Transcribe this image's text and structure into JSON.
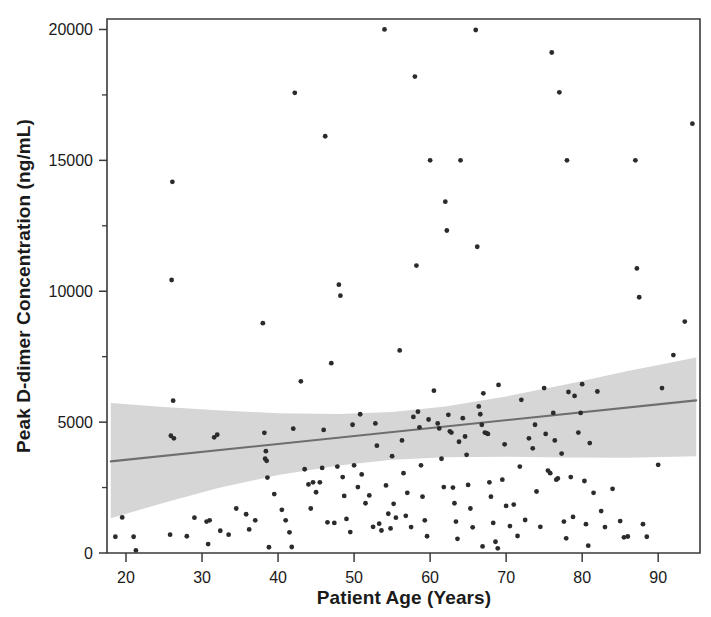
{
  "chart_data": {
    "type": "scatter",
    "title": "",
    "xlabel": "Patient Age (Years)",
    "ylabel": "Peak D-dimer Concentration (ng/mL)",
    "xlim": [
      17.5,
      95.5
    ],
    "ylim": [
      0,
      20400
    ],
    "xticks": [
      20,
      30,
      40,
      50,
      60,
      70,
      80,
      90
    ],
    "xtick_labels": [
      "20",
      "30",
      "40",
      "50",
      "60",
      "70",
      "80",
      "90"
    ],
    "yticks": [
      0,
      5000,
      10000,
      15000,
      20000
    ],
    "ytick_labels": [
      "0",
      "5000",
      "10000",
      "15000",
      "20000"
    ],
    "yticks_minor": [
      2500,
      7500,
      12500,
      17500
    ],
    "grid": false,
    "legend": null,
    "marker_color": "#2b2b2b",
    "marker_size_px": 2.4,
    "regression": {
      "name": "linear fit",
      "color": "#6e6e6e",
      "x": [
        18,
        95
      ],
      "y": [
        3500,
        5830
      ]
    },
    "confidence_band": {
      "name": "95% confidence interval",
      "color": "#d6d6d6",
      "x": [
        18,
        25,
        32,
        40,
        48,
        55,
        62,
        70,
        78,
        86,
        95
      ],
      "upper": [
        5730,
        5580,
        5450,
        5340,
        5310,
        5390,
        5600,
        5980,
        6450,
        6950,
        7470
      ],
      "lower": [
        1330,
        1920,
        2470,
        2980,
        3340,
        3560,
        3660,
        3680,
        3650,
        3640,
        3700
      ]
    },
    "points": [
      [
        26.0,
        10430
      ],
      [
        26.2,
        5820
      ],
      [
        26.3,
        4380
      ],
      [
        25.9,
        4480
      ],
      [
        21.0,
        620
      ],
      [
        21.3,
        100
      ],
      [
        25.8,
        700
      ],
      [
        26.1,
        14180
      ],
      [
        30.6,
        1200
      ],
      [
        31.0,
        1250
      ],
      [
        30.8,
        340
      ],
      [
        31.6,
        4420
      ],
      [
        32.0,
        4520
      ],
      [
        32.4,
        850
      ],
      [
        33.5,
        700
      ],
      [
        35.8,
        1480
      ],
      [
        38.0,
        8780
      ],
      [
        38.2,
        4590
      ],
      [
        38.4,
        3890
      ],
      [
        38.3,
        3600
      ],
      [
        38.5,
        3520
      ],
      [
        38.6,
        2880
      ],
      [
        38.8,
        220
      ],
      [
        36.2,
        900
      ],
      [
        41.0,
        1250
      ],
      [
        41.5,
        790
      ],
      [
        41.8,
        230
      ],
      [
        42.0,
        4750
      ],
      [
        42.2,
        17580
      ],
      [
        43.0,
        6560
      ],
      [
        44.0,
        2620
      ],
      [
        44.3,
        1700
      ],
      [
        44.6,
        2700
      ],
      [
        45.0,
        2320
      ],
      [
        45.5,
        2700
      ],
      [
        46.0,
        4700
      ],
      [
        46.2,
        15920
      ],
      [
        46.5,
        1170
      ],
      [
        47.0,
        7250
      ],
      [
        47.4,
        1150
      ],
      [
        48.0,
        10250
      ],
      [
        48.2,
        9830
      ],
      [
        48.5,
        2900
      ],
      [
        48.7,
        2180
      ],
      [
        49.0,
        1300
      ],
      [
        49.5,
        800
      ],
      [
        50.0,
        3350
      ],
      [
        50.5,
        2520
      ],
      [
        51.0,
        3000
      ],
      [
        51.5,
        1900
      ],
      [
        52.0,
        2200
      ],
      [
        52.5,
        1000
      ],
      [
        53.0,
        4100
      ],
      [
        53.3,
        1120
      ],
      [
        53.6,
        860
      ],
      [
        54.0,
        20000
      ],
      [
        54.2,
        2580
      ],
      [
        54.5,
        1500
      ],
      [
        54.8,
        940
      ],
      [
        55.0,
        3700
      ],
      [
        55.2,
        1880
      ],
      [
        55.5,
        1350
      ],
      [
        56.0,
        7740
      ],
      [
        56.3,
        4300
      ],
      [
        56.5,
        3050
      ],
      [
        56.8,
        1420
      ],
      [
        57.0,
        2300
      ],
      [
        57.5,
        990
      ],
      [
        58.0,
        18200
      ],
      [
        58.2,
        10980
      ],
      [
        58.4,
        5400
      ],
      [
        58.6,
        4800
      ],
      [
        58.8,
        3350
      ],
      [
        59.0,
        2150
      ],
      [
        59.3,
        1250
      ],
      [
        59.6,
        640
      ],
      [
        60.0,
        15000
      ],
      [
        60.5,
        6200
      ],
      [
        61.0,
        4950
      ],
      [
        61.2,
        4760
      ],
      [
        61.5,
        3600
      ],
      [
        61.8,
        2520
      ],
      [
        62.0,
        13420
      ],
      [
        62.2,
        12320
      ],
      [
        62.4,
        5280
      ],
      [
        62.6,
        4650
      ],
      [
        62.8,
        4600
      ],
      [
        63.0,
        2500
      ],
      [
        63.2,
        1900
      ],
      [
        63.4,
        1200
      ],
      [
        63.6,
        540
      ],
      [
        64.0,
        15000
      ],
      [
        64.3,
        5150
      ],
      [
        64.6,
        4450
      ],
      [
        65.0,
        2600
      ],
      [
        65.3,
        1700
      ],
      [
        65.6,
        980
      ],
      [
        66.0,
        19980
      ],
      [
        66.2,
        11700
      ],
      [
        66.4,
        5600
      ],
      [
        66.6,
        5300
      ],
      [
        66.8,
        4900
      ],
      [
        67.0,
        6100
      ],
      [
        67.2,
        4600
      ],
      [
        67.4,
        4580
      ],
      [
        67.6,
        4550
      ],
      [
        67.8,
        2700
      ],
      [
        68.0,
        2150
      ],
      [
        68.3,
        1150
      ],
      [
        68.6,
        430
      ],
      [
        68.9,
        180
      ],
      [
        66.9,
        250
      ],
      [
        69.0,
        6420
      ],
      [
        69.5,
        2800
      ],
      [
        70.0,
        1800
      ],
      [
        70.5,
        1030
      ],
      [
        71.0,
        1850
      ],
      [
        71.5,
        650
      ],
      [
        72.0,
        5850
      ],
      [
        72.5,
        1260
      ],
      [
        73.0,
        4380
      ],
      [
        73.5,
        4000
      ],
      [
        74.0,
        2350
      ],
      [
        74.5,
        1000
      ],
      [
        75.0,
        6300
      ],
      [
        75.2,
        4550
      ],
      [
        75.5,
        3150
      ],
      [
        75.8,
        3050
      ],
      [
        76.0,
        19120
      ],
      [
        76.2,
        5350
      ],
      [
        76.4,
        4300
      ],
      [
        76.6,
        2800
      ],
      [
        76.8,
        2850
      ],
      [
        77.0,
        17600
      ],
      [
        77.3,
        3800
      ],
      [
        77.6,
        1200
      ],
      [
        77.9,
        560
      ],
      [
        78.0,
        15000
      ],
      [
        78.2,
        6150
      ],
      [
        78.5,
        2900
      ],
      [
        78.8,
        1380
      ],
      [
        79.0,
        6000
      ],
      [
        79.5,
        4600
      ],
      [
        80.0,
        6450
      ],
      [
        80.3,
        2750
      ],
      [
        80.5,
        1100
      ],
      [
        80.8,
        280
      ],
      [
        81.0,
        4200
      ],
      [
        81.5,
        2300
      ],
      [
        82.0,
        6170
      ],
      [
        82.5,
        1600
      ],
      [
        83.0,
        990
      ],
      [
        84.0,
        2450
      ],
      [
        85.0,
        1220
      ],
      [
        85.5,
        600
      ],
      [
        86.0,
        630
      ],
      [
        87.0,
        15000
      ],
      [
        87.2,
        10870
      ],
      [
        87.5,
        9770
      ],
      [
        88.0,
        1100
      ],
      [
        88.5,
        620
      ],
      [
        90.0,
        3370
      ],
      [
        92.0,
        7560
      ],
      [
        93.5,
        8840
      ],
      [
        94.5,
        16400
      ],
      [
        90.5,
        6300
      ],
      [
        18.6,
        620
      ],
      [
        19.5,
        1360
      ],
      [
        28.0,
        640
      ],
      [
        29.0,
        1350
      ],
      [
        34.5,
        1700
      ],
      [
        37.0,
        1250
      ],
      [
        39.5,
        2250
      ],
      [
        40.5,
        1650
      ],
      [
        43.5,
        3200
      ],
      [
        45.8,
        3250
      ],
      [
        47.8,
        3300
      ],
      [
        49.8,
        4900
      ],
      [
        50.8,
        5300
      ],
      [
        52.8,
        4950
      ],
      [
        57.8,
        5200
      ],
      [
        59.8,
        5100
      ],
      [
        63.8,
        4250
      ],
      [
        64.8,
        3750
      ],
      [
        69.8,
        4150
      ],
      [
        71.8,
        3300
      ],
      [
        73.8,
        4900
      ],
      [
        79.8,
        5350
      ]
    ]
  }
}
